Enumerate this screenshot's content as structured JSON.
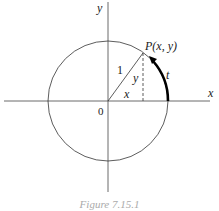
{
  "figure": {
    "labels": {
      "y_axis": "y",
      "x_axis": "x",
      "origin": "0",
      "point": "P(x, y)",
      "radius": "1",
      "vertical_leg": "y",
      "horizontal_leg": "x",
      "arc": "t"
    },
    "caption": "Figure 7.15.1"
  }
}
